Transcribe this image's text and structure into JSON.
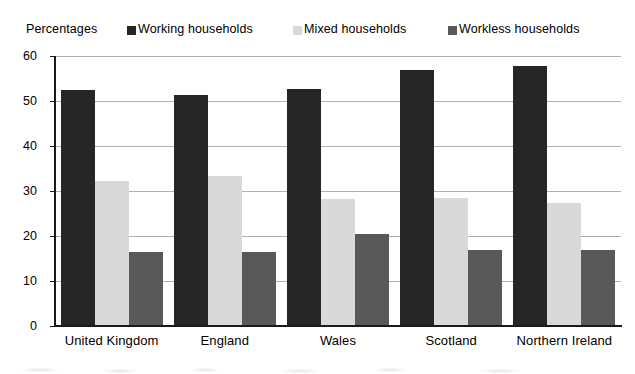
{
  "legend": {
    "title": "Percentages",
    "entries": [
      {
        "label": "Working households",
        "color": "#262626",
        "icon": "square-marker-icon"
      },
      {
        "label": "Mixed households",
        "color": "#d9d9d9",
        "icon": "square-marker-icon"
      },
      {
        "label": "Workless households",
        "color": "#595959",
        "icon": "square-marker-icon"
      }
    ]
  },
  "chart_data": {
    "type": "bar",
    "title": "",
    "xlabel": "",
    "ylabel": "Percentages",
    "ylim": [
      0,
      60
    ],
    "yticks": [
      0,
      10,
      20,
      30,
      40,
      50,
      60
    ],
    "ytick_labels": [
      "0",
      "10",
      "20",
      "30",
      "40",
      "50",
      "60"
    ],
    "grid": true,
    "legend_position": "top",
    "categories": [
      "United Kingdom",
      "England",
      "Wales",
      "Scotland",
      "Northern Ireland"
    ],
    "series": [
      {
        "name": "Working households",
        "color": "#262626",
        "values": [
          52.3,
          51.1,
          52.4,
          56.6,
          57.6
        ]
      },
      {
        "name": "Mixed households",
        "color": "#d9d9d9",
        "values": [
          32.1,
          33.2,
          28.1,
          28.3,
          27.1
        ]
      },
      {
        "name": "Workless households",
        "color": "#595959",
        "values": [
          16.3,
          16.3,
          20.3,
          16.6,
          16.7
        ]
      }
    ]
  }
}
